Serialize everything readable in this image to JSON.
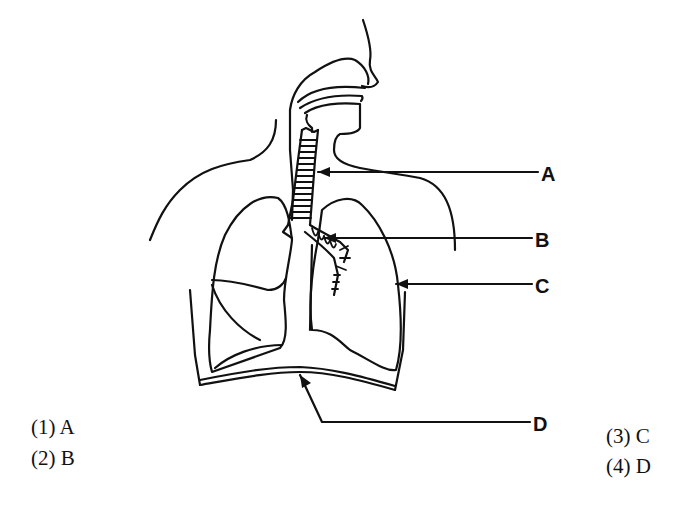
{
  "diagram": {
    "labels": {
      "A": "A",
      "B": "B",
      "C": "C",
      "D": "D"
    }
  },
  "options": [
    {
      "number": "(1)",
      "text": "A"
    },
    {
      "number": "(2)",
      "text": "B"
    },
    {
      "number": "(3)",
      "text": "C"
    },
    {
      "number": "(4)",
      "text": "D"
    }
  ]
}
